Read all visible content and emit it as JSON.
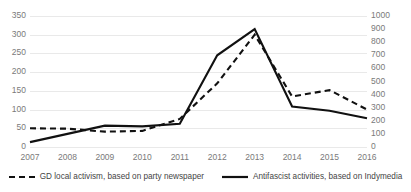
{
  "chart_data": {
    "type": "line",
    "title": "",
    "xlabel": "",
    "ylabel": "",
    "grid": true,
    "legend_position": "bottom",
    "categories": [
      "2007",
      "2008",
      "2009",
      "2010",
      "2011",
      "2012",
      "2013",
      "2014",
      "2015",
      "2016"
    ],
    "axes": {
      "left": {
        "label": "",
        "ylim": [
          0,
          350
        ],
        "ticks": [
          0,
          50,
          100,
          150,
          200,
          250,
          300,
          350
        ],
        "tick_labels": [
          "0",
          "50",
          "100",
          "150",
          "200",
          "250",
          "300",
          "350"
        ]
      },
      "right": {
        "label": "",
        "ylim": [
          0,
          1000
        ],
        "ticks": [
          0,
          100,
          200,
          300,
          400,
          500,
          600,
          700,
          800,
          900,
          1000
        ],
        "tick_labels": [
          "0",
          "100",
          "200",
          "300",
          "400",
          "500",
          "600",
          "700",
          "800",
          "900",
          "1000"
        ]
      }
    },
    "series": [
      {
        "name": "GD local activism, based on party newspaper",
        "axis": "left",
        "style": "dashed",
        "color": "#111111",
        "values": [
          50,
          49,
          41,
          43,
          75,
          170,
          300,
          135,
          152,
          100
        ]
      },
      {
        "name": "Antifascist activities, based on Indymedia",
        "axis": "left",
        "style": "solid",
        "color": "#111111",
        "values": [
          13,
          35,
          57,
          55,
          62,
          245,
          315,
          108,
          97,
          77
        ]
      }
    ]
  },
  "colors": {
    "gridline": "#e9e9e9",
    "tick_text": "#7a7a7a",
    "legend_text": "#444444",
    "series_line": "#111111",
    "background": "#ffffff"
  }
}
